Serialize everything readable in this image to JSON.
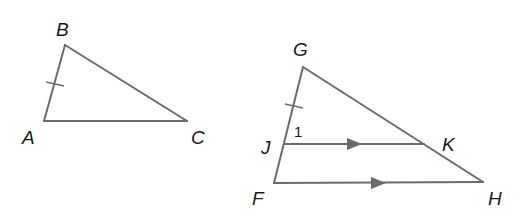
{
  "diagram": {
    "type": "geometry",
    "figures": [
      {
        "name": "triangle-ABC",
        "vertices": {
          "A": [
            44,
            121
          ],
          "B": [
            65,
            45
          ],
          "C": [
            187,
            121
          ]
        },
        "labels": {
          "A": "A",
          "B": "B",
          "C": "C"
        },
        "tick_marks": [
          "AB"
        ]
      },
      {
        "name": "triangle-FGH",
        "vertices": {
          "G": [
            303,
            67
          ],
          "J": [
            284,
            144
          ],
          "F": [
            274,
            183
          ],
          "K": [
            424,
            144
          ],
          "H": [
            483,
            182
          ]
        },
        "labels": {
          "G": "G",
          "J": "J",
          "F": "F",
          "K": "K",
          "H": "H"
        },
        "tick_marks": [
          "GJ"
        ],
        "parallel_segments": [
          "JK",
          "FH"
        ],
        "angle_labels": {
          "angle_1": "1"
        }
      }
    ],
    "colors": {
      "line": "#6b6b6b",
      "text": "#1a1a1a",
      "background": "#ffffff"
    }
  }
}
